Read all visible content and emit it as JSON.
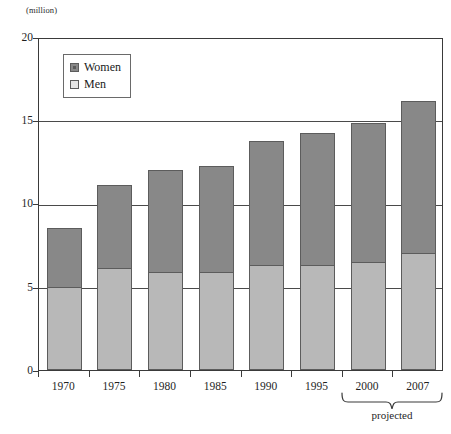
{
  "chart_data": {
    "type": "bar",
    "subtype": "stacked-vertical",
    "title": "",
    "subtitle": "",
    "unit_label": "(million)",
    "xlabel": "",
    "ylabel": "",
    "ylim": [
      0,
      20
    ],
    "yticks": [
      0,
      5,
      10,
      15,
      20
    ],
    "ytick_labels": [
      "0",
      "5",
      "10",
      "15",
      "20"
    ],
    "grid": true,
    "grid_axis": "y",
    "legend_position": "inside-top-left",
    "categories": [
      "1970",
      "1975",
      "1980",
      "1985",
      "1990",
      "1995",
      "2000",
      "2007"
    ],
    "series": [
      {
        "name": "Men",
        "color": "#b8b8b8",
        "values": [
          5.0,
          6.1,
          5.9,
          5.9,
          6.3,
          6.3,
          6.5,
          7.0
        ]
      },
      {
        "name": "Women",
        "color": "#888888",
        "values": [
          3.6,
          5.1,
          6.2,
          6.4,
          7.5,
          8.0,
          8.4,
          9.2
        ]
      }
    ],
    "totals": [
      8.6,
      11.2,
      12.1,
      12.3,
      13.8,
      14.3,
      14.9,
      16.2
    ],
    "annotations": [
      {
        "text": "projected",
        "covers": [
          "2000",
          "2007"
        ],
        "style": "brace-below-axis"
      }
    ]
  },
  "legend": {
    "items": [
      {
        "label": "Women",
        "swatch": "dark-gray"
      },
      {
        "label": "Men",
        "swatch": "light-gray"
      }
    ]
  }
}
